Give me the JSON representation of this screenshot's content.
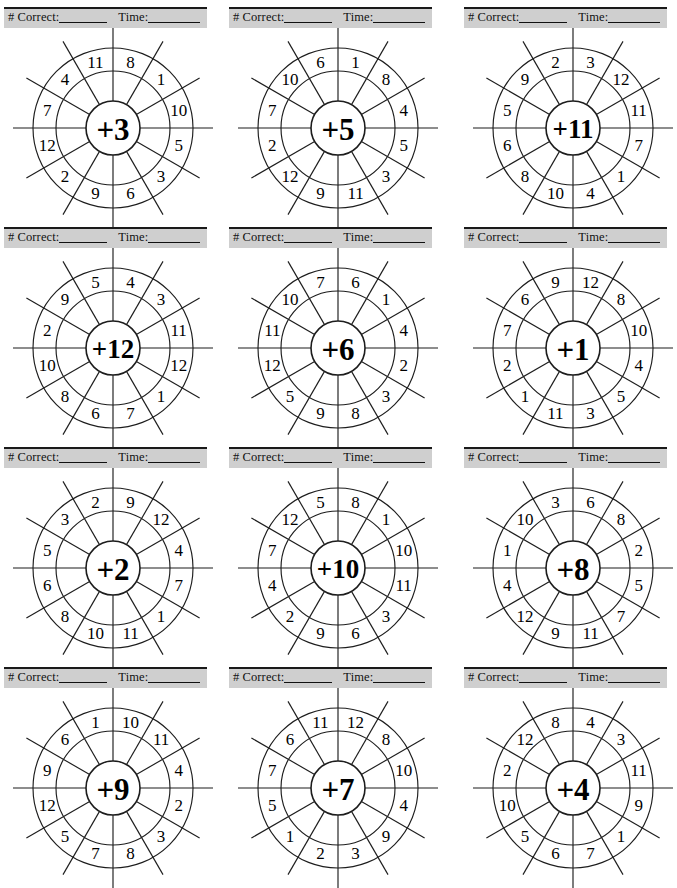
{
  "page": {
    "columns": 3,
    "rows": 4,
    "cell_width": 221,
    "cell_height": 220
  },
  "score_bar": {
    "correct_label": "# Correct:",
    "time_label": "Time:",
    "correct_blank": "________",
    "time_blank": "________",
    "background_color": "#cfcfcf",
    "text_color": "#111111"
  },
  "wheel_geometry": {
    "hub_radius": 27,
    "inner_ring_radius": 57,
    "outer_ring_radius": 80,
    "spoke_outer_radius": 100,
    "sector_count": 12,
    "number_radius": 68,
    "note": "numbers are centered between sector boundaries; boundaries every 30 degrees"
  },
  "chart_data": {
    "type": "table",
    "columns": [
      "center",
      "outer numbers clockwise from top"
    ],
    "wheels": [
      {
        "id": "wheel-1",
        "center": "+3",
        "operand": 3,
        "numbers": [
          8,
          1,
          10,
          5,
          3,
          6,
          9,
          2,
          12,
          7,
          4,
          11
        ]
      },
      {
        "id": "wheel-2",
        "center": "+5",
        "operand": 5,
        "numbers": [
          1,
          8,
          4,
          5,
          3,
          11,
          9,
          12,
          2,
          7,
          10,
          6
        ]
      },
      {
        "id": "wheel-3",
        "center": "+11",
        "operand": 11,
        "numbers": [
          3,
          12,
          11,
          7,
          1,
          4,
          10,
          8,
          6,
          5,
          9,
          2
        ]
      },
      {
        "id": "wheel-4",
        "center": "+12",
        "operand": 12,
        "numbers": [
          4,
          3,
          11,
          12,
          1,
          7,
          6,
          8,
          10,
          2,
          9,
          5
        ]
      },
      {
        "id": "wheel-5",
        "center": "+6",
        "operand": 6,
        "numbers": [
          6,
          1,
          4,
          2,
          3,
          8,
          9,
          5,
          12,
          11,
          10,
          7
        ]
      },
      {
        "id": "wheel-6",
        "center": "+1",
        "operand": 1,
        "numbers": [
          12,
          8,
          10,
          4,
          5,
          3,
          11,
          1,
          2,
          7,
          6,
          9
        ]
      },
      {
        "id": "wheel-7",
        "center": "+2",
        "operand": 2,
        "numbers": [
          9,
          12,
          4,
          7,
          1,
          11,
          10,
          8,
          6,
          5,
          3,
          2
        ]
      },
      {
        "id": "wheel-8",
        "center": "+10",
        "operand": 10,
        "numbers": [
          8,
          1,
          10,
          11,
          3,
          6,
          9,
          2,
          4,
          7,
          12,
          5
        ]
      },
      {
        "id": "wheel-9",
        "center": "+8",
        "operand": 8,
        "numbers": [
          6,
          8,
          2,
          5,
          7,
          11,
          9,
          12,
          4,
          1,
          10,
          3
        ]
      },
      {
        "id": "wheel-10",
        "center": "+9",
        "operand": 9,
        "numbers": [
          10,
          11,
          4,
          2,
          3,
          8,
          7,
          5,
          12,
          9,
          6,
          1
        ]
      },
      {
        "id": "wheel-11",
        "center": "+7",
        "operand": 7,
        "numbers": [
          12,
          8,
          10,
          4,
          9,
          3,
          2,
          1,
          5,
          7,
          6,
          11
        ]
      },
      {
        "id": "wheel-12",
        "center": "+4",
        "operand": 4,
        "numbers": [
          4,
          3,
          11,
          9,
          1,
          7,
          6,
          5,
          10,
          2,
          12,
          8
        ]
      }
    ]
  }
}
